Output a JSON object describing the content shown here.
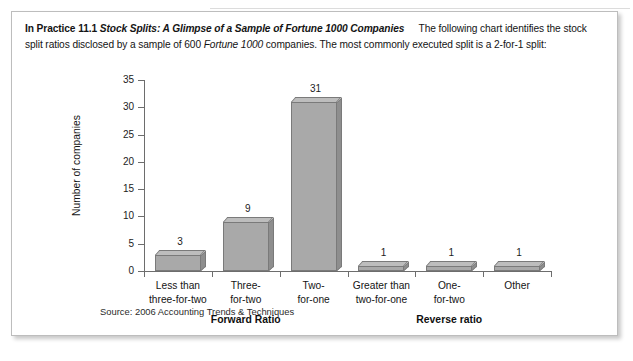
{
  "intro": {
    "label": "In Practice 11.1",
    "title": "Stock Splits: A Glimpse of a Sample of Fortune 1000 Companies",
    "body_1": "The following chart identifies the stock split ratios disclosed by a sample of 600 ",
    "body_italic": "Fortune 1000",
    "body_2": " companies. The most commonly executed split is a 2-for-1 split:"
  },
  "chart_data": {
    "type": "bar",
    "title": "",
    "xlabel": "",
    "ylabel": "Number of companies",
    "categories": [
      "Less than three-for-two",
      "Three-for-two",
      "Two-for-one",
      "Greater than two-for-one",
      "One-for-two",
      "Other"
    ],
    "category_lines": [
      [
        "Less than",
        "three-for-two"
      ],
      [
        "Three-",
        "for-two"
      ],
      [
        "Two-",
        "for-one"
      ],
      [
        "Greater than",
        "two-for-one"
      ],
      [
        "One-",
        "for-two"
      ],
      [
        "Other",
        ""
      ]
    ],
    "values": [
      3,
      9,
      31,
      1,
      1,
      1
    ],
    "ylim": [
      0,
      35
    ],
    "yticks": [
      0,
      5,
      10,
      15,
      20,
      25,
      30,
      35
    ],
    "grid": false,
    "legend": "none",
    "groups": [
      {
        "label": "Forward Ratio",
        "categories": [
          0,
          1,
          2
        ]
      },
      {
        "label": "Reverse ratio",
        "categories": [
          3,
          4,
          5
        ]
      }
    ],
    "bar_color": "#a9a9a9",
    "bar_edge_color": "#7a7a7a"
  },
  "source": "Source: 2006 Accounting Trends & Techniques"
}
